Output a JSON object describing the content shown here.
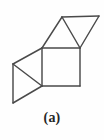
{
  "figure": {
    "caption": "(a)",
    "kind": "polyhedron-net-diagram",
    "line_color": "#4a4a4a",
    "background_color": "#fefefe",
    "caption_color": "#262626",
    "canvas": {
      "width": 104,
      "height": 140
    },
    "vertices": {
      "square_top_left": {
        "x": 42,
        "y": 48
      },
      "square_top_right": {
        "x": 80,
        "y": 48
      },
      "square_bottom_right": {
        "x": 80,
        "y": 86
      },
      "square_bottom_left": {
        "x": 42,
        "y": 86
      },
      "top_apex": {
        "x": 62,
        "y": 17
      },
      "top_right_corner": {
        "x": 99,
        "y": 16
      },
      "left_upper": {
        "x": 13,
        "y": 64
      },
      "left_lower": {
        "x": 13,
        "y": 103
      }
    },
    "shapes": [
      {
        "name": "center-square",
        "type": "square",
        "points": "42,48 80,48 80,86 42,86"
      },
      {
        "name": "top-up-triangle",
        "type": "triangle",
        "points": "42,48 62,17 80,48"
      },
      {
        "name": "top-right-down-triangle",
        "type": "triangle",
        "points": "62,17 99,16 80,48"
      },
      {
        "name": "left-upper-triangle",
        "type": "triangle",
        "points": "42,48 13,64 42,86"
      },
      {
        "name": "left-lower-triangle",
        "type": "triangle",
        "points": "13,64 13,103 42,86"
      }
    ],
    "edges": [
      {
        "name": "square-top-edge",
        "x1": 42,
        "y1": 48,
        "x2": 80,
        "y2": 48
      },
      {
        "name": "square-right-edge",
        "x1": 80,
        "y1": 48,
        "x2": 80,
        "y2": 86
      },
      {
        "name": "square-bottom-edge",
        "x1": 80,
        "y1": 86,
        "x2": 42,
        "y2": 86
      },
      {
        "name": "square-left-edge",
        "x1": 42,
        "y1": 86,
        "x2": 42,
        "y2": 48
      },
      {
        "name": "top-triangle-left-edge",
        "x1": 42,
        "y1": 48,
        "x2": 62,
        "y2": 17
      },
      {
        "name": "top-triangle-right-edge",
        "x1": 62,
        "y1": 17,
        "x2": 80,
        "y2": 48
      },
      {
        "name": "upper-right-top-edge",
        "x1": 62,
        "y1": 17,
        "x2": 99,
        "y2": 16
      },
      {
        "name": "upper-right-slant-edge",
        "x1": 99,
        "y1": 16,
        "x2": 80,
        "y2": 48
      },
      {
        "name": "left-upper-slant-edge",
        "x1": 42,
        "y1": 48,
        "x2": 13,
        "y2": 64
      },
      {
        "name": "left-vertical-edge",
        "x1": 13,
        "y1": 64,
        "x2": 13,
        "y2": 103
      },
      {
        "name": "left-middle-diagonal-edge",
        "x1": 13,
        "y1": 64,
        "x2": 42,
        "y2": 86
      },
      {
        "name": "left-lower-slant-edge",
        "x1": 13,
        "y1": 103,
        "x2": 42,
        "y2": 86
      }
    ]
  }
}
